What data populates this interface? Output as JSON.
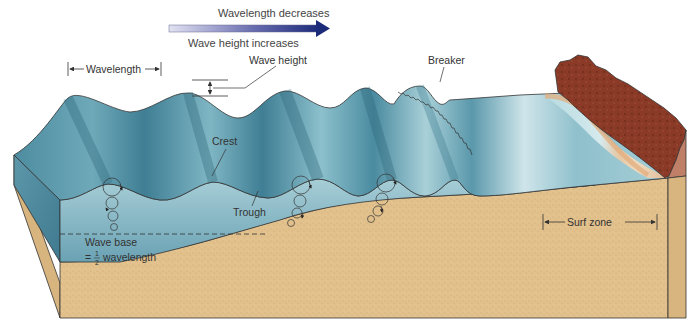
{
  "diagram": {
    "cut_off_top_text": "",
    "trend_arrow": {
      "top_label": "Wavelength decreases",
      "bottom_label": "Wave height increases",
      "gradient_start": "#dcdcf0",
      "gradient_end": "#1c2a7a"
    },
    "labels": {
      "wavelength": "Wavelength",
      "wave_height": "Wave height",
      "breaker": "Breaker",
      "crest": "Crest",
      "trough": "Trough",
      "wave_base_line1": "Wave base",
      "wave_base_eq": "=",
      "wave_base_num": "1",
      "wave_base_den": "2",
      "wave_base_word": "wavelength",
      "surf_zone": "Surf zone"
    },
    "colors": {
      "water_surface_dark": "#3f7e94",
      "water_surface_light": "#a9d0d8",
      "water_front": "#9cc6d1",
      "water_front_deep": "#6ea5b7",
      "sand": "#e2c18c",
      "sand_side": "#d8b47e",
      "beach": "#ecc9a0",
      "cliff": "#8a3a26",
      "cliff_side": "#c08068",
      "outline": "#333333"
    }
  }
}
